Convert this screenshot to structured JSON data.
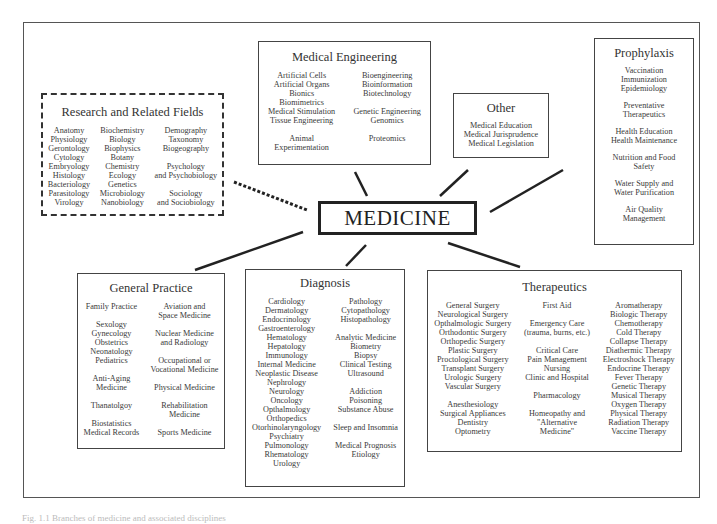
{
  "center": {
    "label": "MEDICINE"
  },
  "boxes": {
    "research": {
      "title": "Research and Related Fields",
      "columns": [
        [
          "Anatomy",
          "Physiology",
          "Gerontology",
          "Cytology",
          "Embryology",
          "Histology",
          "Bacteriology",
          "Parasitology",
          "Virology"
        ],
        [
          "Biochemistry",
          "Biology",
          "Biophysics",
          "Botany",
          "Chemistry",
          "Ecology",
          "Genetics",
          "Microbiology",
          "Nanobiology"
        ],
        [
          "Demography",
          "Taxonomy",
          "Biogeography",
          "",
          "Psychology",
          "and Psychobiology",
          "",
          "Sociology",
          "and Sociobiology"
        ]
      ]
    },
    "engineering": {
      "title": "Medical Engineering",
      "columns": [
        [
          "Artificial Cells",
          "Artificial Organs",
          "Bionics",
          "Biomimetrics",
          "Medical Stimulation",
          "Tissue Engineering",
          "",
          "Animal",
          "Experimentation"
        ],
        [
          "Bioengineering",
          "Bioinformation",
          "Biotechnology",
          "",
          "Genetic Engineering",
          "Genomics",
          "",
          "Proteomics",
          ""
        ]
      ]
    },
    "other": {
      "title": "Other",
      "items": [
        "Medical Education",
        "Medical Jurisprudence",
        "Medical Legislation"
      ]
    },
    "prophylaxis": {
      "title": "Prophylaxis",
      "groups": [
        [
          "Vaccination",
          "Immunization",
          "Epidemiology"
        ],
        [
          "Preventative",
          "Therapeutics"
        ],
        [
          "Health Education",
          "Health Maintenance"
        ],
        [
          "Nutrition and Food",
          "Safety"
        ],
        [
          "Water Supply and",
          "Water Purification"
        ],
        [
          "Air Quality",
          "Management"
        ]
      ]
    },
    "general_practice": {
      "title": "General Practice",
      "left_groups": [
        [
          "Family Practice"
        ],
        [
          "Sexology",
          "Gynecology",
          "Obstetrics",
          "Neonatology",
          "Pediatrics"
        ],
        [
          "Anti-Aging",
          "Medicine"
        ],
        [
          "Thanatolgoy"
        ],
        [
          "Biostatistics",
          "Medical Records"
        ]
      ],
      "right_groups": [
        [
          "Aviation and",
          "Space Medicine"
        ],
        [
          "Nuclear Medicine",
          "and Radiology"
        ],
        [
          "Occupational or",
          "Vocational Medicine"
        ],
        [
          "Physical Medicine"
        ],
        [
          "Rehabilitation",
          "Medicine"
        ],
        [
          "Sports Medicine"
        ]
      ]
    },
    "diagnosis": {
      "title": "Diagnosis",
      "left": [
        "Cardiology",
        "Dermatology",
        "Endocrinology",
        "Gastroenterology",
        "Hematology",
        "Hepatology",
        "Immunology",
        "Internal Medicine",
        "Neoplastic Disease",
        "Nephrology",
        "Neurology",
        "Oncology",
        "Opthalmology",
        "Orthopedics",
        "Otorhinolaryngology",
        "Psychiatry",
        "Pulmonology",
        "Rhematology",
        "Urology"
      ],
      "right_groups": [
        [
          "Pathology",
          "Cytopathology",
          "Histopathology"
        ],
        [
          "Analytic Medicine",
          "Biometry",
          "Biopsy",
          "Clinical Testing",
          "Ultrasound"
        ],
        [
          "Addiction",
          "Poisoning",
          "Substance Abuse"
        ],
        [
          "Sleep and Insomnia"
        ],
        [
          "Medical Prognosis",
          "Etiology"
        ]
      ]
    },
    "therapeutics": {
      "title": "Therapeutics",
      "left_groups": [
        [
          "General Surgery",
          "Neurological Surgery",
          "Opthalmologic Surgery",
          "Orthodontic Surgery",
          "Orthopedic Surgery",
          "Plastic Surgery",
          "Proctological Surgery",
          "Transplant Surgery",
          "Urologic Surgery",
          "Vascular Surgery"
        ],
        [
          "Anesthesiology",
          "Surgical Appliances",
          "Dentistry",
          "Optometry"
        ]
      ],
      "middle_groups": [
        [
          "First Aid"
        ],
        [
          "Emergency Care",
          "(trauma, burns, etc.)"
        ],
        [
          "Critical Care",
          "Pain Management",
          "Nursing",
          "Clinic and Hospital"
        ],
        [
          "Pharmacology"
        ],
        [
          "Homeopathy and",
          "\"Alternative",
          "Medicine\""
        ]
      ],
      "right": [
        "Aromatherapy",
        "Biologic Therapy",
        "Chemotherapy",
        "Cold Therapy",
        "Collapse Therapy",
        "Diathermic Therapy",
        "Electroshock Therapy",
        "Endocrine Therapy",
        "Fever Therapy",
        "Genetic Therapy",
        "Musical Therapy",
        "Oxygen Therapy",
        "Physical Therapy",
        "Radiation Therapy",
        "Vaccine Therapy"
      ]
    }
  },
  "caption": "Fig. 1.1 Branches of medicine and associated disciplines"
}
